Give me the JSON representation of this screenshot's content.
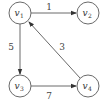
{
  "graph": {
    "type": "directed-weighted",
    "nodes": [
      {
        "id": "v1",
        "label": "v",
        "sub": "1"
      },
      {
        "id": "v2",
        "label": "v",
        "sub": "2"
      },
      {
        "id": "v3",
        "label": "v",
        "sub": "3"
      },
      {
        "id": "v4",
        "label": "v",
        "sub": "4"
      }
    ],
    "edges": [
      {
        "from": "v1",
        "to": "v2",
        "weight": "1"
      },
      {
        "from": "v1",
        "to": "v3",
        "weight": "5"
      },
      {
        "from": "v3",
        "to": "v4",
        "weight": "7"
      },
      {
        "from": "v4",
        "to": "v1",
        "weight": "3"
      }
    ]
  },
  "colors": {
    "stroke": "#6a6a6a",
    "text": "#333333"
  }
}
